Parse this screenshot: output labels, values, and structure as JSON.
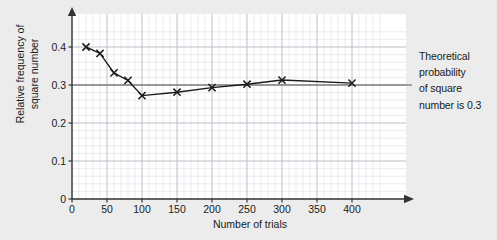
{
  "chart_data": {
    "type": "line",
    "title": "",
    "xlabel": "Number of trials",
    "ylabel_line1": "Relative frequency of",
    "ylabel_line2": "square number",
    "x": [
      20,
      40,
      60,
      80,
      100,
      150,
      200,
      250,
      300,
      400
    ],
    "values": [
      0.4,
      0.383,
      0.332,
      0.312,
      0.272,
      0.281,
      0.293,
      0.302,
      0.313,
      0.305
    ],
    "series": [
      {
        "name": "Relative frequency of square number",
        "x": [
          20,
          40,
          60,
          80,
          100,
          150,
          200,
          250,
          300,
          400
        ],
        "values": [
          0.4,
          0.383,
          0.332,
          0.312,
          0.272,
          0.281,
          0.293,
          0.302,
          0.313,
          0.305
        ],
        "marker": "x",
        "color": "#1a1a1a"
      }
    ],
    "reference_line": {
      "label": "Theoretical probability of square number is 0.3",
      "value": 0.3,
      "orientation": "horizontal",
      "color": "#555555"
    },
    "xlim": [
      0,
      440
    ],
    "ylim": [
      0,
      0.45
    ],
    "xticks": [
      0,
      50,
      100,
      150,
      200,
      250,
      300,
      350,
      400
    ],
    "xtick_labels": [
      "0",
      "50",
      "100",
      "150",
      "200",
      "250",
      "300",
      "350",
      "400"
    ],
    "yticks": [
      0,
      0.1,
      0.2,
      0.3,
      0.4
    ],
    "ytick_labels": [
      "0",
      "0.1",
      "0.2",
      "0.3",
      "0.4"
    ],
    "grid": true,
    "minor_grid": true,
    "legend": "none"
  },
  "annotation": {
    "line1": "Theoretical",
    "line2": "probability",
    "line3": "of square",
    "line4": "number is 0.3"
  },
  "axes": {
    "x_title": "Number of trials",
    "y_title_line1": "Relative frequency of",
    "y_title_line2": "square number"
  },
  "colors": {
    "background": "#ececec",
    "plot_background": "#ffffff",
    "axis": "#333333",
    "grid_major": "#b9bcc4",
    "grid_minor": "#dfe2e8",
    "series": "#1a1a1a",
    "reference": "#555555",
    "text": "#1a1a1a"
  }
}
